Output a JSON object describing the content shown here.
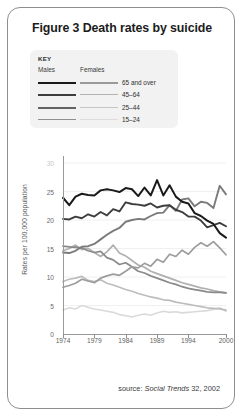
{
  "figure": {
    "title": "Figure 3 Death rates by suicide",
    "source_prefix": "source: ",
    "source_italic": "Social Trends",
    "source_suffix": " 32, 2002"
  },
  "key": {
    "heading": "KEY",
    "col_males": "Males",
    "col_females": "Females",
    "rows": [
      {
        "label": "65 and over",
        "male_color": "#1a1a1a",
        "female_color": "#9a9a9a"
      },
      {
        "label": "45–64",
        "male_color": "#3d3d3d",
        "female_color": "#b4b4b4"
      },
      {
        "label": "25–44",
        "male_color": "#636363",
        "female_color": "#c6c6c6"
      },
      {
        "label": "15–24",
        "male_color": "#8f8f8f",
        "female_color": "#dcdcdc"
      }
    ]
  },
  "chart_data": {
    "type": "line",
    "title": "Figure 3 Death rates by suicide",
    "xlabel": "",
    "ylabel": "Rates per 100,000 population",
    "xlim": [
      1974,
      2000
    ],
    "ylim": [
      0,
      30
    ],
    "yticks": [
      0,
      5,
      10,
      15,
      20,
      25,
      30
    ],
    "xticks": [
      1974,
      1979,
      1984,
      1989,
      1994,
      2000
    ],
    "grid": true,
    "legend": "KEY box, upper-left, outside axes",
    "x": [
      1974,
      1975,
      1976,
      1977,
      1978,
      1979,
      1980,
      1981,
      1982,
      1983,
      1984,
      1985,
      1986,
      1987,
      1988,
      1989,
      1990,
      1991,
      1992,
      1993,
      1994,
      1995,
      1996,
      1997,
      1998,
      1999,
      2000
    ],
    "series": [
      {
        "name": "Males 65 and over",
        "color": "#1a1a1a",
        "width": 2.0,
        "values": [
          23.9,
          22.6,
          24.1,
          24.6,
          24.4,
          24.3,
          25.2,
          25.4,
          25.2,
          24.9,
          25.6,
          25.4,
          24.2,
          25.7,
          24.3,
          27.0,
          24.3,
          26.1,
          24.1,
          23.2,
          22.9,
          21.2,
          20.7,
          19.9,
          19.3,
          17.7,
          16.9
        ]
      },
      {
        "name": "Males 45-64",
        "color": "#3d3d3d",
        "width": 1.9,
        "values": [
          20.2,
          20.1,
          20.6,
          20.3,
          21.0,
          20.6,
          21.4,
          20.8,
          21.9,
          21.5,
          23.1,
          22.8,
          22.7,
          22.5,
          22.9,
          22.2,
          22.5,
          22.6,
          21.8,
          21.4,
          20.6,
          20.6,
          19.9,
          18.7,
          19.1,
          19.5,
          18.9
        ]
      },
      {
        "name": "Males 25-44",
        "color": "#7b7b7b",
        "width": 1.9,
        "values": [
          14.3,
          14.2,
          14.6,
          15.3,
          15.4,
          15.8,
          16.6,
          17.4,
          18.1,
          18.6,
          19.7,
          20.0,
          20.2,
          20.1,
          20.7,
          21.2,
          21.3,
          22.6,
          21.6,
          23.6,
          23.8,
          22.4,
          23.2,
          23.0,
          22.1,
          26.0,
          24.5
        ]
      },
      {
        "name": "Males 15-24",
        "color": "#9d9d9d",
        "width": 1.7,
        "values": [
          8.2,
          8.5,
          8.9,
          9.6,
          9.3,
          9.0,
          9.8,
          10.2,
          10.5,
          10.3,
          11.0,
          11.8,
          11.6,
          12.4,
          11.9,
          13.1,
          12.6,
          14.0,
          13.6,
          14.7,
          14.0,
          15.2,
          16.0,
          15.4,
          16.2,
          15.1,
          13.9
        ]
      },
      {
        "name": "Females 65 and over",
        "color": "#8a8a8a",
        "width": 1.7,
        "values": [
          15.4,
          15.3,
          15.2,
          15.1,
          14.6,
          14.3,
          14.5,
          13.4,
          13.0,
          12.2,
          12.5,
          11.8,
          11.0,
          10.7,
          10.2,
          9.8,
          9.4,
          9.0,
          8.7,
          8.3,
          8.0,
          7.8,
          7.6,
          7.4,
          7.3,
          7.3,
          7.2
        ]
      },
      {
        "name": "Females 45-64",
        "color": "#b0b0b0",
        "width": 1.7,
        "values": [
          14.6,
          15.0,
          15.6,
          14.8,
          15.0,
          14.3,
          13.6,
          14.4,
          15.6,
          14.2,
          13.7,
          12.9,
          12.1,
          11.7,
          11.0,
          10.6,
          10.2,
          9.8,
          9.4,
          9.0,
          8.7,
          8.4,
          8.1,
          7.9,
          7.6,
          7.4,
          7.2
        ]
      },
      {
        "name": "Females 25-44",
        "color": "#bdbdbd",
        "width": 1.7,
        "values": [
          9.2,
          9.6,
          9.8,
          10.1,
          9.4,
          9.2,
          9.5,
          8.9,
          8.6,
          8.2,
          7.8,
          7.5,
          7.1,
          6.8,
          6.5,
          6.3,
          6.0,
          5.9,
          5.6,
          5.4,
          5.2,
          5.0,
          4.8,
          4.6,
          4.5,
          4.4,
          4.2
        ]
      },
      {
        "name": "Females 15-24",
        "color": "#dadada",
        "width": 1.6,
        "values": [
          4.2,
          4.6,
          4.4,
          5.0,
          4.7,
          4.4,
          4.2,
          4.0,
          3.8,
          3.4,
          3.2,
          3.0,
          3.3,
          3.5,
          3.3,
          3.7,
          4.0,
          3.8,
          3.9,
          3.7,
          3.8,
          3.9,
          4.0,
          4.1,
          4.3,
          4.6,
          4.0
        ]
      }
    ]
  }
}
